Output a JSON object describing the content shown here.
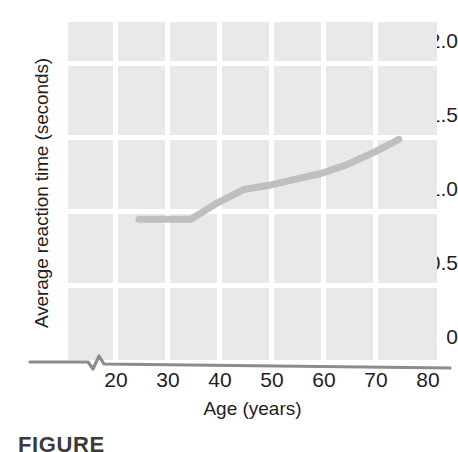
{
  "figure": {
    "caption_prefix": "FIGURE",
    "background_color": "#ffffff",
    "panel_color": "#e9e9e9",
    "gridline_color": "#ffffff",
    "line_color": "#bfbfbf",
    "axis_color": "#8c8c8c",
    "text_color": "#231f20"
  },
  "chart_data": {
    "type": "line",
    "title": "",
    "xlabel": "Age (years)",
    "ylabel": "Average reaction time (seconds)",
    "xlim": [
      15,
      80
    ],
    "ylim": [
      0,
      2.15
    ],
    "xticks": [
      20,
      30,
      40,
      50,
      60,
      70,
      80
    ],
    "xtick_labels": [
      "20",
      "30",
      "40",
      "50",
      "60",
      "70",
      "80"
    ],
    "yticks": [
      0,
      0.5,
      1.0,
      1.5,
      2.0
    ],
    "ytick_labels": [
      "0",
      "0.5",
      "1.0",
      "1.5",
      "2.0"
    ],
    "grid": true,
    "grid_style": "white lines on gray panel",
    "legend": "none",
    "axis_break": true,
    "axis_break_note": "zigzag break on x-axis between 0 and 20",
    "series": [
      {
        "name": "Average reaction time",
        "x": [
          25,
          30,
          35,
          40,
          45,
          50,
          55,
          60,
          65,
          70,
          75
        ],
        "y": [
          0.93,
          0.93,
          0.93,
          1.04,
          1.13,
          1.16,
          1.2,
          1.24,
          1.3,
          1.38,
          1.47
        ]
      }
    ]
  }
}
